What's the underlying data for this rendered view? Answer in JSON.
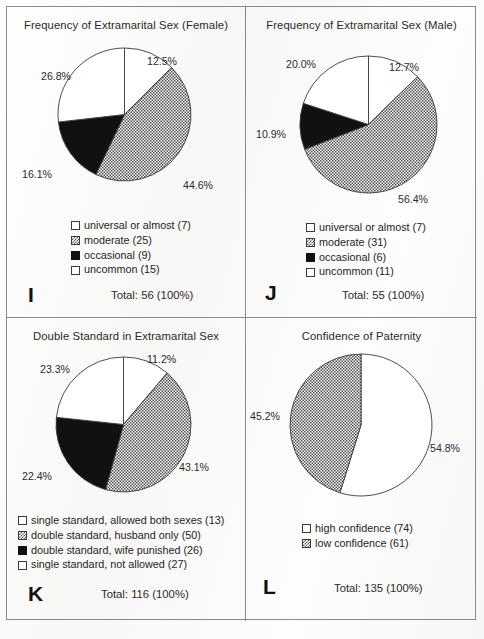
{
  "figure": {
    "panel_count": 4,
    "background_color": "#fbfbfa",
    "border_color": "#8a8a8a",
    "fill_white": "#ffffff",
    "fill_black": "#111111",
    "fill_hatched_gray": "#808080"
  },
  "panels": [
    {
      "letter": "I",
      "title": "Frequency of Extramarital Sex (Female)",
      "total": "Total: 56 (100%)",
      "legend": [
        {
          "label": "universal or almost (7)",
          "swatch": "white"
        },
        {
          "label": "moderate (25)",
          "swatch": "hatch"
        },
        {
          "label": "occasional (9)",
          "swatch": "black"
        },
        {
          "label": "uncommon (15)",
          "swatch": "white"
        }
      ],
      "labels": [
        "12.5%",
        "44.6%",
        "16.1%",
        "26.8%"
      ]
    },
    {
      "letter": "J",
      "title": "Frequency of Extramarital Sex (Male)",
      "total": "Total: 55 (100%)",
      "legend": [
        {
          "label": "universal or almost (7)",
          "swatch": "white"
        },
        {
          "label": "moderate (31)",
          "swatch": "hatch"
        },
        {
          "label": "occasional (6)",
          "swatch": "black"
        },
        {
          "label": "uncommon (11)",
          "swatch": "white"
        }
      ],
      "labels": [
        "12.7%",
        "56.4%",
        "10.9%",
        "20.0%"
      ]
    },
    {
      "letter": "K",
      "title": "Double Standard in Extramarital Sex",
      "total": "Total: 116 (100%)",
      "legend": [
        {
          "label": "single standard, allowed both sexes (13)",
          "swatch": "white"
        },
        {
          "label": "double standard, husband only (50)",
          "swatch": "hatch"
        },
        {
          "label": "double standard, wife punished (26)",
          "swatch": "black"
        },
        {
          "label": "single standard, not allowed (27)",
          "swatch": "white"
        }
      ],
      "labels": [
        "11.2%",
        "43.1%",
        "22.4%",
        "23.3%"
      ]
    },
    {
      "letter": "L",
      "title": "Confidence of Paternity",
      "total": "Total: 135 (100%)",
      "legend": [
        {
          "label": "high confidence (74)",
          "swatch": "white"
        },
        {
          "label": "low confidence (61)",
          "swatch": "hatch"
        }
      ],
      "labels": [
        "54.8%",
        "45.2%"
      ]
    }
  ],
  "chart_data": [
    {
      "type": "pie",
      "panel": "I",
      "title": "Frequency of Extramarital Sex (Female)",
      "total_label": "Total: 56 (100%)",
      "total": 56,
      "start_angle_deg": 0,
      "direction": "clockwise",
      "categories": [
        "universal or almost",
        "moderate",
        "occasional",
        "uncommon"
      ],
      "counts": [
        7,
        25,
        9,
        15
      ],
      "percents": [
        12.5,
        44.6,
        16.1,
        26.8
      ],
      "fills": [
        "white",
        "hatched-gray",
        "black",
        "white"
      ],
      "legend_position": "below-chart"
    },
    {
      "type": "pie",
      "panel": "J",
      "title": "Frequency of Extramarital Sex (Male)",
      "total_label": "Total: 55 (100%)",
      "total": 55,
      "start_angle_deg": 0,
      "direction": "clockwise",
      "categories": [
        "universal or almost",
        "moderate",
        "occasional",
        "uncommon"
      ],
      "counts": [
        7,
        31,
        6,
        11
      ],
      "percents": [
        12.7,
        56.4,
        10.9,
        20.0
      ],
      "fills": [
        "white",
        "hatched-gray",
        "black",
        "white"
      ],
      "legend_position": "below-chart"
    },
    {
      "type": "pie",
      "panel": "K",
      "title": "Double Standard in Extramarital Sex",
      "total_label": "Total: 116 (100%)",
      "total": 116,
      "start_angle_deg": 0,
      "direction": "clockwise",
      "categories": [
        "single standard, allowed both sexes",
        "double standard, husband only",
        "double standard, wife punished",
        "single standard, not allowed"
      ],
      "counts": [
        13,
        50,
        26,
        27
      ],
      "percents": [
        11.2,
        43.1,
        22.4,
        23.3
      ],
      "fills": [
        "white",
        "hatched-gray",
        "black",
        "white"
      ],
      "legend_position": "below-chart"
    },
    {
      "type": "pie",
      "panel": "L",
      "title": "Confidence of Paternity",
      "total_label": "Total: 135 (100%)",
      "total": 135,
      "start_angle_deg": 0,
      "direction": "clockwise",
      "categories": [
        "high confidence",
        "low confidence"
      ],
      "counts": [
        74,
        61
      ],
      "percents": [
        54.8,
        45.2
      ],
      "fills": [
        "white",
        "hatched-gray"
      ],
      "legend_position": "below-chart"
    }
  ]
}
